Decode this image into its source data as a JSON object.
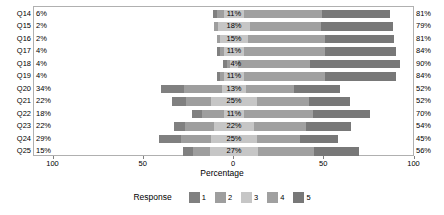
{
  "chart_data": {
    "type": "bar",
    "subtype": "diverging-stacked-likert",
    "title": "",
    "xlabel": "Percentage",
    "ylabel": "",
    "xlim": [
      -100,
      100
    ],
    "xticks": [
      -100,
      -50,
      0,
      50,
      100
    ],
    "xticklabels": [
      "100",
      "50",
      "0",
      "50",
      "100"
    ],
    "grid": false,
    "legend": {
      "title": "Response",
      "position": "bottom",
      "entries": [
        {
          "label": "1",
          "color": "#808080"
        },
        {
          "label": "2",
          "color": "#9e9e9e"
        },
        {
          "label": "3",
          "color": "#c6c6c6"
        },
        {
          "label": "4",
          "color": "#a0a0a0"
        },
        {
          "label": "5",
          "color": "#787878"
        }
      ]
    },
    "categories": [
      "Q14",
      "Q15",
      "Q16",
      "Q17",
      "Q18",
      "Q19",
      "Q20",
      "Q21",
      "Q22",
      "Q23",
      "Q24",
      "Q25"
    ],
    "series": [
      {
        "name": "1",
        "values": [
          2,
          0,
          0,
          2,
          2,
          2,
          13,
          8,
          6,
          6,
          12,
          6
        ]
      },
      {
        "name": "2",
        "values": [
          4,
          2,
          2,
          2,
          2,
          2,
          21,
          14,
          12,
          16,
          17,
          9
        ]
      },
      {
        "name": "3",
        "values": [
          11,
          18,
          15,
          11,
          4,
          11,
          13,
          25,
          11,
          22,
          25,
          27
        ]
      },
      {
        "name": "4",
        "values": [
          43,
          39,
          43,
          45,
          40,
          45,
          27,
          29,
          38,
          29,
          24,
          31
        ]
      },
      {
        "name": "5",
        "values": [
          38,
          40,
          38,
          39,
          50,
          39,
          25,
          23,
          32,
          25,
          21,
          25
        ]
      }
    ],
    "rows": [
      {
        "category": "Q14",
        "left_label": "6%",
        "center_label": "11%",
        "right_label": "81%",
        "negative": 6,
        "neutral": 11,
        "positive": 81,
        "seg1": 2,
        "seg2": 4,
        "seg3": 11,
        "seg4": 43,
        "seg5": 38
      },
      {
        "category": "Q15",
        "left_label": "2%",
        "center_label": "18%",
        "right_label": "79%",
        "negative": 2,
        "neutral": 18,
        "positive": 79,
        "seg1": 0,
        "seg2": 2,
        "seg3": 18,
        "seg4": 39,
        "seg5": 40
      },
      {
        "category": "Q16",
        "left_label": "2%",
        "center_label": "15%",
        "right_label": "81%",
        "negative": 2,
        "neutral": 15,
        "positive": 81,
        "seg1": 0,
        "seg2": 2,
        "seg3": 15,
        "seg4": 43,
        "seg5": 38
      },
      {
        "category": "Q17",
        "left_label": "4%",
        "center_label": "11%",
        "right_label": "84%",
        "negative": 4,
        "neutral": 11,
        "positive": 84,
        "seg1": 2,
        "seg2": 2,
        "seg3": 11,
        "seg4": 45,
        "seg5": 39
      },
      {
        "category": "Q18",
        "left_label": "4%",
        "center_label": "4%",
        "right_label": "90%",
        "negative": 4,
        "neutral": 4,
        "positive": 90,
        "seg1": 2,
        "seg2": 2,
        "seg3": 4,
        "seg4": 40,
        "seg5": 50
      },
      {
        "category": "Q19",
        "left_label": "4%",
        "center_label": "11%",
        "right_label": "84%",
        "negative": 4,
        "neutral": 11,
        "positive": 84,
        "seg1": 2,
        "seg2": 2,
        "seg3": 11,
        "seg4": 45,
        "seg5": 39
      },
      {
        "category": "Q20",
        "left_label": "34%",
        "center_label": "13%",
        "right_label": "52%",
        "negative": 34,
        "neutral": 13,
        "positive": 52,
        "seg1": 13,
        "seg2": 21,
        "seg3": 13,
        "seg4": 27,
        "seg5": 25
      },
      {
        "category": "Q21",
        "left_label": "22%",
        "center_label": "25%",
        "right_label": "52%",
        "negative": 22,
        "neutral": 25,
        "positive": 52,
        "seg1": 8,
        "seg2": 14,
        "seg3": 25,
        "seg4": 29,
        "seg5": 23
      },
      {
        "category": "Q22",
        "left_label": "18%",
        "center_label": "11%",
        "right_label": "70%",
        "negative": 18,
        "neutral": 11,
        "positive": 70,
        "seg1": 6,
        "seg2": 12,
        "seg3": 11,
        "seg4": 38,
        "seg5": 32
      },
      {
        "category": "Q23",
        "left_label": "22%",
        "center_label": "22%",
        "right_label": "54%",
        "negative": 22,
        "neutral": 22,
        "positive": 54,
        "seg1": 6,
        "seg2": 16,
        "seg3": 22,
        "seg4": 29,
        "seg5": 25
      },
      {
        "category": "Q24",
        "left_label": "29%",
        "center_label": "25%",
        "right_label": "45%",
        "negative": 29,
        "neutral": 25,
        "positive": 45,
        "seg1": 12,
        "seg2": 17,
        "seg3": 25,
        "seg4": 24,
        "seg5": 21
      },
      {
        "category": "Q25",
        "left_label": "15%",
        "center_label": "27%",
        "right_label": "56%",
        "negative": 15,
        "neutral": 27,
        "positive": 56,
        "seg1": 6,
        "seg2": 9,
        "seg3": 27,
        "seg4": 31,
        "seg5": 25
      }
    ]
  }
}
